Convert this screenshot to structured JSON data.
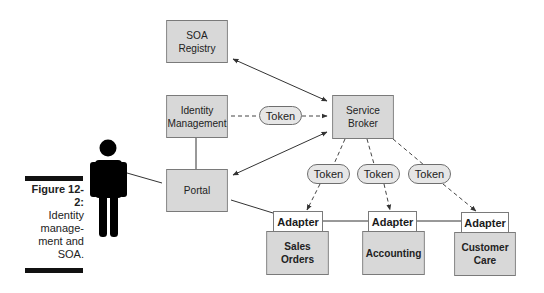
{
  "figure": {
    "caption_title": "Figure 12-2:",
    "caption_body": "Identity\nmanage-\nment and\nSOA."
  },
  "nodes": {
    "soa_registry": "SOA\nRegistry",
    "identity_management": "Identity\nManagement",
    "service_broker": "Service\nBroker",
    "portal": "Portal",
    "sales_orders": "Sales\nOrders",
    "accounting": "Accounting",
    "customer_care": "Customer\nCare"
  },
  "adapters": [
    "Adapter",
    "Adapter",
    "Adapter"
  ],
  "tokens": [
    "Token",
    "Token",
    "Token",
    "Token"
  ],
  "colors": {
    "box_fill": "#d8d8d8",
    "box_border": "#7a7a7a",
    "adapter_fill": "#ffffff",
    "token_fill": "#e6e6e6",
    "line": "#333333",
    "person": "#000000"
  },
  "connections": [
    {
      "from": "SOA Registry",
      "to": "Service Broker",
      "style": "solid",
      "arrows": "both"
    },
    {
      "from": "Identity Management",
      "to": "Service Broker",
      "style": "dashed",
      "via": "Token",
      "arrows": "end"
    },
    {
      "from": "Identity Management",
      "to": "Portal",
      "style": "solid",
      "arrows": "none"
    },
    {
      "from": "Portal",
      "to": "Service Broker",
      "style": "solid",
      "arrows": "both"
    },
    {
      "from": "User",
      "to": "Portal",
      "style": "solid",
      "arrows": "none"
    },
    {
      "from": "Portal",
      "to": "Adapter (Sales Orders)",
      "style": "solid",
      "arrows": "none"
    },
    {
      "from": "Service Broker",
      "to": "Adapter (Sales Orders)",
      "style": "dashed",
      "via": "Token",
      "arrows": "end"
    },
    {
      "from": "Service Broker",
      "to": "Adapter (Accounting)",
      "style": "dashed",
      "via": "Token",
      "arrows": "end"
    },
    {
      "from": "Service Broker",
      "to": "Adapter (Customer Care)",
      "style": "dashed",
      "via": "Token",
      "arrows": "end"
    },
    {
      "from": "Adapter (Sales Orders)",
      "to": "Adapter (Accounting)",
      "style": "solid",
      "arrows": "none"
    },
    {
      "from": "Adapter (Accounting)",
      "to": "Adapter (Customer Care)",
      "style": "solid",
      "arrows": "none"
    }
  ]
}
